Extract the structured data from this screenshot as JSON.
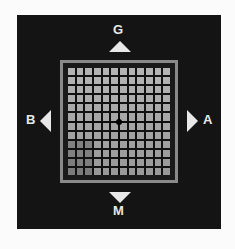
{
  "diagram": {
    "labels": {
      "top": "G",
      "bottom": "M",
      "left": "B",
      "right": "A"
    },
    "grid": {
      "rows": 12,
      "columns": 12,
      "center_marker": "dot"
    },
    "colors": {
      "panel": "#141414",
      "frame": "#8a8a8a",
      "cell": "#9a9a9a",
      "arrow": "#e8e8e8"
    }
  }
}
